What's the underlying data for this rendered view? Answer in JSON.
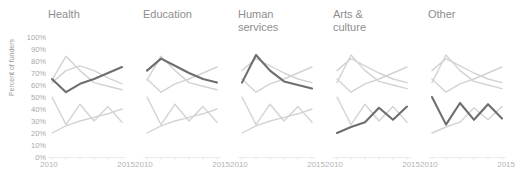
{
  "chart_data": {
    "type": "line",
    "title": "",
    "xlabel": "",
    "ylabel": "Percent of funders",
    "xlim": [
      2010,
      2015
    ],
    "ylim": [
      0,
      1.0
    ],
    "grid": false,
    "legend": "none",
    "layout": "small-multiples",
    "x": [
      2010,
      2011,
      2012,
      2013,
      2014,
      2015
    ],
    "xtick_labels": [
      "2010",
      "2015"
    ],
    "ytick_labels": [
      "100%",
      "90%",
      "80%",
      "70%",
      "60%",
      "50%",
      "40%",
      "30%",
      "20%",
      "10%",
      "0%"
    ],
    "ytick_values": [
      100,
      90,
      80,
      70,
      60,
      50,
      40,
      30,
      20,
      10,
      0
    ],
    "highlight_color": "#6e6e6e",
    "context_color": "#d3d3d3",
    "panels": [
      {
        "label": "Health",
        "highlight_series": {
          "name": "Health",
          "values": [
            65,
            54,
            61,
            65,
            70,
            75
          ]
        },
        "context_series": [
          {
            "name": "Education",
            "values": [
              62,
              72,
              76,
              72,
              66,
              61
            ]
          },
          {
            "name": "Human services",
            "values": [
              64,
              84,
              72,
              62,
              59,
              56
            ]
          },
          {
            "name": "Arts & culture",
            "values": [
              20,
              26,
              30,
              33,
              36,
              40
            ]
          },
          {
            "name": "Other",
            "values": [
              50,
              27,
              44,
              30,
              42,
              29
            ]
          }
        ]
      },
      {
        "label": "Education",
        "highlight_series": {
          "name": "Education",
          "values": [
            72,
            82,
            76,
            70,
            65,
            62
          ]
        },
        "context_series": [
          {
            "name": "Health",
            "values": [
              65,
              54,
              61,
              65,
              70,
              75
            ]
          },
          {
            "name": "Human services",
            "values": [
              64,
              84,
              72,
              62,
              59,
              56
            ]
          },
          {
            "name": "Arts & culture",
            "values": [
              20,
              26,
              30,
              33,
              36,
              40
            ]
          },
          {
            "name": "Other",
            "values": [
              50,
              27,
              44,
              30,
              42,
              29
            ]
          }
        ]
      },
      {
        "label": "Human\nservices",
        "highlight_series": {
          "name": "Human services",
          "values": [
            62,
            85,
            72,
            63,
            60,
            57
          ]
        },
        "context_series": [
          {
            "name": "Health",
            "values": [
              65,
              54,
              61,
              65,
              70,
              75
            ]
          },
          {
            "name": "Education",
            "values": [
              72,
              82,
              76,
              70,
              65,
              62
            ]
          },
          {
            "name": "Arts & culture",
            "values": [
              20,
              26,
              30,
              33,
              36,
              40
            ]
          },
          {
            "name": "Other",
            "values": [
              50,
              27,
              44,
              30,
              42,
              29
            ]
          }
        ]
      },
      {
        "label": "Arts &\nculture",
        "highlight_series": {
          "name": "Arts & culture",
          "values": [
            20,
            25,
            29,
            41,
            31,
            42
          ]
        },
        "context_series": [
          {
            "name": "Health",
            "values": [
              65,
              54,
              61,
              65,
              70,
              75
            ]
          },
          {
            "name": "Education",
            "values": [
              72,
              82,
              76,
              70,
              65,
              62
            ]
          },
          {
            "name": "Human services",
            "values": [
              62,
              85,
              72,
              63,
              60,
              57
            ]
          },
          {
            "name": "Other",
            "values": [
              50,
              27,
              44,
              30,
              42,
              29
            ]
          }
        ]
      },
      {
        "label": "Other",
        "highlight_series": {
          "name": "Other",
          "values": [
            50,
            27,
            45,
            31,
            44,
            32
          ]
        },
        "context_series": [
          {
            "name": "Health",
            "values": [
              65,
              54,
              61,
              65,
              70,
              75
            ]
          },
          {
            "name": "Education",
            "values": [
              72,
              82,
              76,
              70,
              65,
              62
            ]
          },
          {
            "name": "Human services",
            "values": [
              62,
              85,
              72,
              63,
              60,
              57
            ]
          },
          {
            "name": "Arts & culture",
            "values": [
              20,
              25,
              29,
              41,
              31,
              42
            ]
          }
        ]
      }
    ]
  }
}
